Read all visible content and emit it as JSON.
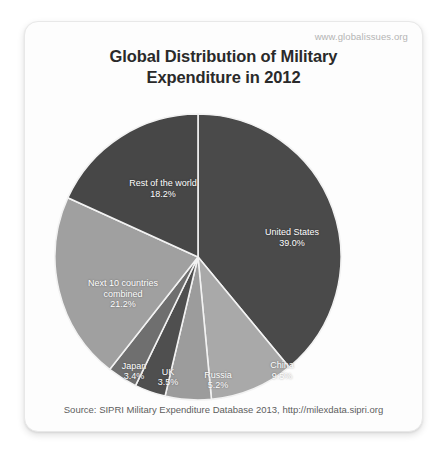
{
  "watermark": "www.globalissues.org",
  "title_line1": "Global Distribution of Military",
  "title_line2": "Expenditure in 2012",
  "source": "Source: SIPRI Military Expenditure Database 2013, http://milexdata.sipri.org",
  "labels": {
    "united_states": "United States",
    "united_states_pct": "39.0%",
    "china": "China",
    "china_pct": "9.5%",
    "russia": "Russia",
    "russia_pct": "5.2%",
    "uk": "UK",
    "uk_pct": "3.5%",
    "japan": "Japan",
    "japan_pct": "3.4%",
    "next10_line1": "Next 10 countries",
    "next10_line2": "combined",
    "next10_pct": "21.2%",
    "rest": "Rest of the world",
    "rest_pct": "18.2%"
  },
  "chart_data": {
    "type": "pie",
    "title": "Global Distribution of Military Expenditure in 2012",
    "unit": "percent",
    "start_angle_deg": 0,
    "direction": "clockwise",
    "legend": "none",
    "labels_inside_slices": true,
    "categories": [
      "United States",
      "China",
      "Russia",
      "UK",
      "Japan",
      "Next 10 countries combined",
      "Rest of the world"
    ],
    "values": [
      39.0,
      9.5,
      5.2,
      3.5,
      3.4,
      21.2,
      18.2
    ],
    "colors": [
      "#4a4a4a",
      "#a9a9a9",
      "#9c9c9c",
      "#4f4f4f",
      "#6f6f6f",
      "#a0a0a0",
      "#474747"
    ],
    "total": 100.0,
    "source": "SIPRI Military Expenditure Database 2013, http://milexdata.sipri.org"
  },
  "colors": {
    "card_background": "#fdfdfd",
    "title_text": "#2a2a2a",
    "watermark_text": "#b4b4b4",
    "source_text": "#5d5d5d",
    "slice_separator": "#f2f2f2"
  }
}
